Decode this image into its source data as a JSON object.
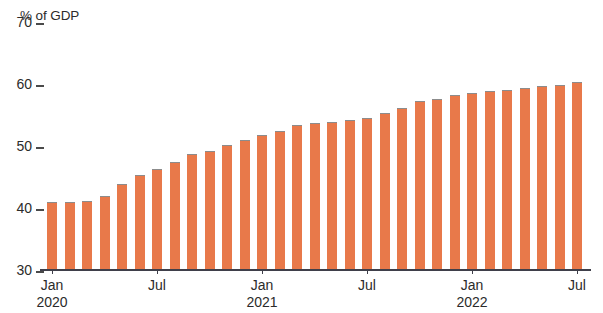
{
  "chart_data": {
    "type": "bar",
    "title": "",
    "subtitle": "",
    "xlabel": "",
    "ylabel": "% of GDP",
    "ylim": [
      30,
      70
    ],
    "yticks": [
      70,
      60,
      50,
      40,
      30
    ],
    "grid": false,
    "legend": null,
    "bar_color": "#e8794a",
    "bar_edge_color": "#8c8c8c",
    "axis_color": "#3f3f4a",
    "text_color": "#2b2b2b",
    "background": "#ffffff",
    "xtick_labels": [
      {
        "label": "Jan",
        "year": "2020"
      },
      {
        "label": "Jul",
        "year": ""
      },
      {
        "label": "Jan",
        "year": "2021"
      },
      {
        "label": "Jul",
        "year": ""
      },
      {
        "label": "Jan",
        "year": "2022"
      },
      {
        "label": "Jul",
        "year": ""
      }
    ],
    "categories": [
      "Jan 2020",
      "Feb 2020",
      "Mar 2020",
      "Apr 2020",
      "May 2020",
      "Jun 2020",
      "Jul 2020",
      "Aug 2020",
      "Sep 2020",
      "Oct 2020",
      "Nov 2020",
      "Dec 2020",
      "Jan 2021",
      "Feb 2021",
      "Mar 2021",
      "Apr 2021",
      "May 2021",
      "Jun 2021",
      "Jul 2021",
      "Aug 2021",
      "Sep 2021",
      "Oct 2021",
      "Nov 2021",
      "Dec 2021",
      "Jan 2022",
      "Feb 2022",
      "Mar 2022",
      "Apr 2022",
      "May 2022",
      "Jun 2022",
      "Jul 2022"
    ],
    "values": [
      41.0,
      41.0,
      41.2,
      42.0,
      43.9,
      45.3,
      46.3,
      47.4,
      48.7,
      49.2,
      50.1,
      51.0,
      51.7,
      52.5,
      53.4,
      53.7,
      53.8,
      54.2,
      54.5,
      55.3,
      56.1,
      57.2,
      57.6,
      58.2,
      58.6,
      58.8,
      59.1,
      59.3,
      59.7,
      59.9,
      60.3
    ]
  }
}
